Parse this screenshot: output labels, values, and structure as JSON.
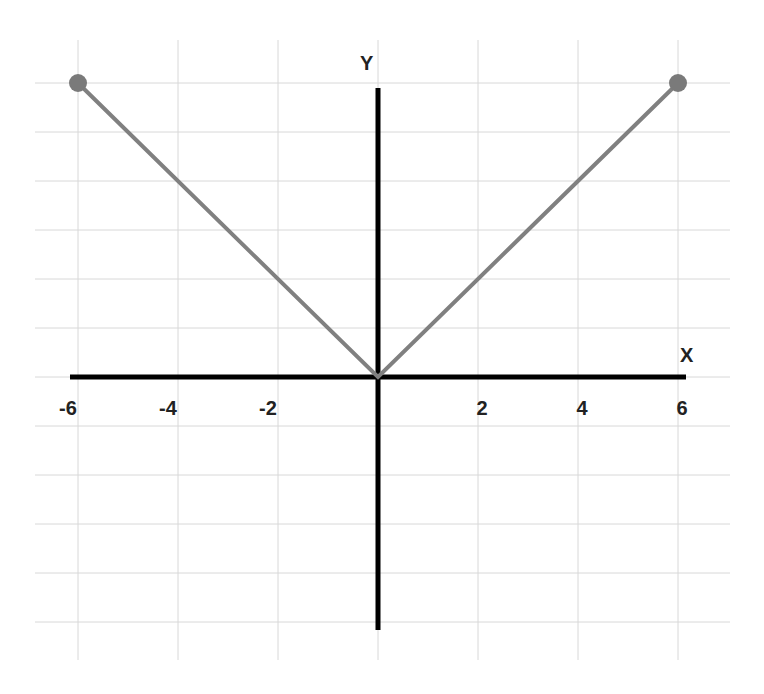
{
  "chart_data": {
    "type": "line",
    "title": "",
    "xlabel": "X",
    "ylabel": "Y",
    "x_ticks": [
      "-6",
      "-4",
      "-2",
      "2",
      "4",
      "6"
    ],
    "x_tick_values": [
      -6,
      -4,
      -2,
      2,
      4,
      6
    ],
    "xlim": [
      -6.5,
      6.5
    ],
    "ylim": [
      -5.5,
      6.5
    ],
    "grid": true,
    "series": [
      {
        "name": "y = |x|",
        "x": [
          -6,
          0,
          6
        ],
        "y": [
          6,
          0,
          6
        ],
        "color": "#808080",
        "endpoint_markers": true
      }
    ]
  },
  "labels": {
    "x_axis": "X",
    "y_axis": "Y"
  },
  "colors": {
    "axis": "#000000",
    "grid": "#d8d8d8",
    "line": "#808080",
    "marker": "#7a7a7a"
  }
}
